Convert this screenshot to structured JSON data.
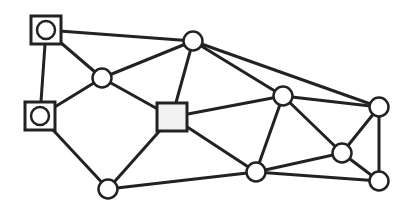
{
  "diagram": {
    "type": "graph",
    "style": {
      "stroke": "#222222",
      "node_fill": "#ffffff",
      "square_fill": "#f2f2f2",
      "stroke_width": 3
    },
    "nodes": [
      {
        "id": "A",
        "shape": "square-circle",
        "x": 46,
        "y": 30
      },
      {
        "id": "B",
        "shape": "square-circle",
        "x": 40,
        "y": 116
      },
      {
        "id": "C",
        "shape": "circle",
        "x": 102,
        "y": 78
      },
      {
        "id": "D",
        "shape": "circle",
        "x": 193,
        "y": 41
      },
      {
        "id": "E",
        "shape": "square",
        "x": 172,
        "y": 117
      },
      {
        "id": "F",
        "shape": "circle",
        "x": 108,
        "y": 189
      },
      {
        "id": "G",
        "shape": "circle",
        "x": 283,
        "y": 96
      },
      {
        "id": "H",
        "shape": "circle",
        "x": 256,
        "y": 172
      },
      {
        "id": "I",
        "shape": "circle",
        "x": 342,
        "y": 153
      },
      {
        "id": "J",
        "shape": "circle",
        "x": 379,
        "y": 107
      },
      {
        "id": "K",
        "shape": "circle",
        "x": 379,
        "y": 181
      }
    ],
    "edges": [
      [
        "A",
        "D"
      ],
      [
        "A",
        "C"
      ],
      [
        "A",
        "B"
      ],
      [
        "B",
        "C"
      ],
      [
        "B",
        "F"
      ],
      [
        "C",
        "D"
      ],
      [
        "C",
        "E"
      ],
      [
        "D",
        "E"
      ],
      [
        "D",
        "G"
      ],
      [
        "D",
        "J"
      ],
      [
        "E",
        "G"
      ],
      [
        "E",
        "F"
      ],
      [
        "E",
        "H"
      ],
      [
        "F",
        "H"
      ],
      [
        "G",
        "J"
      ],
      [
        "G",
        "H"
      ],
      [
        "G",
        "I"
      ],
      [
        "H",
        "I"
      ],
      [
        "H",
        "K"
      ],
      [
        "I",
        "J"
      ],
      [
        "I",
        "K"
      ],
      [
        "J",
        "K"
      ]
    ]
  }
}
